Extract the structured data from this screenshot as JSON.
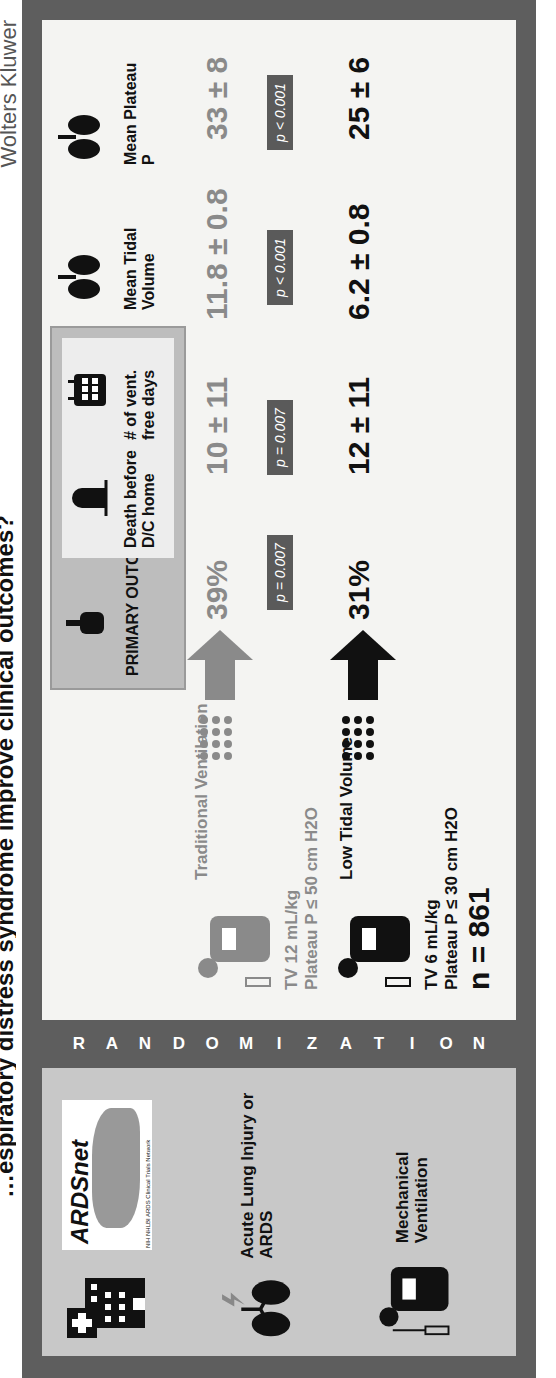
{
  "title": "…espiratory distress syndrome improve clinical outcomes?",
  "publisher": "Wolters Kluwer",
  "left_panel": {
    "logo": {
      "name": "ARDSnet",
      "subtitle": "NIH NHLBI ARDS Clinical Trials Network"
    },
    "items": [
      {
        "icon": "hospital-icon",
        "label": ""
      },
      {
        "icon": "lungs-lightning-icon",
        "label": "Acute Lung Injury or ARDS"
      },
      {
        "icon": "ventilator-patient-icon",
        "label": "Mechanical Ventilation"
      }
    ]
  },
  "randomization": [
    "R",
    "A",
    "N",
    "D",
    "O",
    "M",
    "I",
    "Z",
    "A",
    "T",
    "I",
    "O",
    "N"
  ],
  "main": {
    "primary_outcomes_label": "PRIMARY OUTCOMES",
    "columns": [
      {
        "header": "Death before D/C home",
        "icon": "tombstone-icon"
      },
      {
        "header": "# of vent. free days",
        "icon": "calendar-icon"
      },
      {
        "header": "Mean Tidal Volume",
        "icon": "lungs-icon"
      },
      {
        "header": "Mean Plateau P",
        "icon": "lungs-icon"
      }
    ],
    "arms": [
      {
        "name": "Traditional Ventilation",
        "settings_line1": "TV 12 mL/kg",
        "settings_line2": "Plateau P ≤ 50 cm H2O",
        "color": "#8a8a8a",
        "values": [
          "39%",
          "10 ± 11",
          "11.8 ± 0.8",
          "33 ± 8"
        ]
      },
      {
        "name": "Low Tidal Volume",
        "settings_line1": "TV 6 mL/kg",
        "settings_line2": "Plateau P ≤ 30 cm H2O",
        "color": "#111111",
        "values": [
          "31%",
          "12 ± 11",
          "6.2 ± 0.8",
          "25 ± 6"
        ]
      }
    ],
    "p_values": [
      "p = 0.007",
      "p = 0.007",
      "p < 0.001",
      "p < 0.001"
    ],
    "n_label": "n = 861"
  }
}
